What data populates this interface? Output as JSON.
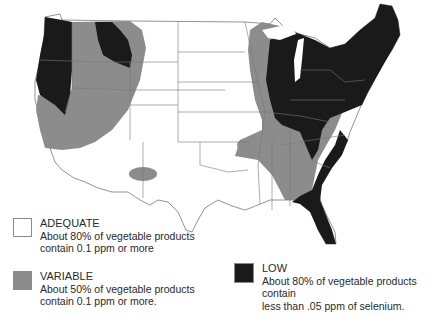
{
  "map": {
    "subject": "Selenium content of vegetable products in the United States",
    "colors": {
      "adequate": "#ffffff",
      "variable": "#8c8c8c",
      "low": "#1a1a1a",
      "state_border": "#777777"
    }
  },
  "legend": {
    "items": [
      {
        "key": "adequate",
        "title": "ADEQUATE",
        "line1": "About 80% of vegetable products",
        "line2": "contain 0.1 ppm or more"
      },
      {
        "key": "variable",
        "title": "VARIABLE",
        "line1": "About 50% of vegetable products",
        "line2": "contain 0.1 ppm or more."
      },
      {
        "key": "low",
        "title": "LOW",
        "line1": "About 80% of vegetable products contain",
        "line2": "less than .05 ppm of selenium."
      }
    ]
  }
}
